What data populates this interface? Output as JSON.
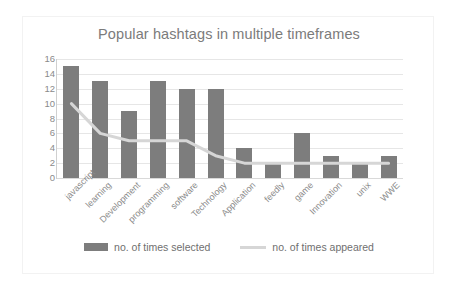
{
  "chart_data": {
    "type": "bar",
    "title": "Popular hashtags in multiple timeframes",
    "xlabel": "",
    "ylabel": "",
    "ylim": [
      0,
      16
    ],
    "ytick_step": 2,
    "yticks": [
      "16",
      "14",
      "12",
      "10",
      "8",
      "6",
      "4",
      "2",
      "0"
    ],
    "grid": true,
    "legend_position": "bottom",
    "categories": [
      "javascript",
      "learning",
      "Development",
      "programming",
      "software",
      "Technology",
      "Application",
      "feedly",
      "game",
      "Innovation",
      "unix",
      "WWE"
    ],
    "series": [
      {
        "name": "no. of times selected",
        "type": "bar",
        "color": "#7d7d7d",
        "values": [
          15,
          13,
          9,
          13,
          12,
          12,
          4,
          2,
          6,
          3,
          2,
          3
        ]
      },
      {
        "name": "no. of times appeared",
        "type": "line",
        "color": "#d6d6d6",
        "values": [
          10,
          6,
          5,
          5,
          5,
          3,
          2,
          2,
          2,
          2,
          2,
          2
        ]
      }
    ]
  },
  "legend": {
    "items": [
      {
        "label": "no. of times selected",
        "marker": "bar-swatch"
      },
      {
        "label": "no. of times appeared",
        "marker": "line-swatch"
      }
    ]
  },
  "colors": {
    "bar": "#7d7d7d",
    "line": "#d6d6d6",
    "grid": "#e6e6e6",
    "text": "#8a8a8a",
    "title_text": "#7b7b7b",
    "background": "#ffffff",
    "border": "#f2f2f2"
  }
}
